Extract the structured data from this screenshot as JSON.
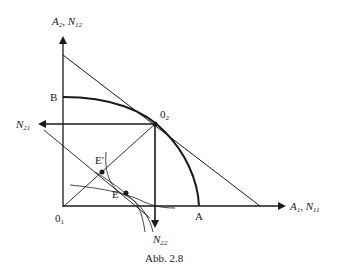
{
  "figure": {
    "caption": "Abb. 2.8",
    "axes": {
      "y_label": {
        "main1": "A",
        "sub1": "2",
        "sep": ", ",
        "main2": "N",
        "sub2": "12"
      },
      "x_label": {
        "main1": "A",
        "sub1": "1",
        "sep": ", ",
        "main2": "N",
        "sub2": "11"
      },
      "left_label": {
        "main": "N",
        "sub": "21"
      },
      "down_label": {
        "main": "N",
        "sub": "22"
      }
    },
    "points": {
      "O1": {
        "main": "0",
        "sub": "1"
      },
      "O2": {
        "main": "0",
        "sub": "2"
      },
      "A": "A",
      "B": "B",
      "E": "E",
      "E_prime": "E′"
    },
    "colors": {
      "stroke": "#1a1a1a",
      "background": "#ffffff"
    }
  }
}
